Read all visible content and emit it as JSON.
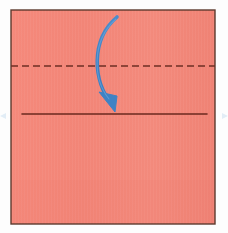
{
  "diagram": {
    "title": "Origami fold step",
    "type": "origami-instruction",
    "caption": "",
    "canvas": {
      "width": 228,
      "height": 233
    },
    "background_color": "#fdfdfd"
  },
  "paper": {
    "name": "square-sheet",
    "shape": "square",
    "fill_color": "#f4897b",
    "fill_color_shade": "#ef7e70",
    "border_color": "#5c3a2e",
    "border_width": 1.4,
    "x": 11,
    "y": 10,
    "width": 204,
    "height": 214
  },
  "fold_line": {
    "name": "valley-fold-line",
    "style": "dashed",
    "meaning": "fold line",
    "color": "#6e2f24",
    "stroke_width": 1.6,
    "dash_pattern": "7 4",
    "x1": 11,
    "y1": 66,
    "x2": 215,
    "y2": 66
  },
  "crease_line": {
    "name": "existing-crease-line",
    "style": "solid",
    "meaning": "existing crease / reference edge",
    "color": "#6b2a1f",
    "stroke_width": 1.6,
    "x1": 22,
    "y1": 114,
    "x2": 207,
    "y2": 114
  },
  "arrow": {
    "name": "fold-direction-arrow",
    "color": "#3f82c4",
    "highlight_color": "#68a6dd",
    "stroke_width": 3.6,
    "direction": "downward",
    "meaning": "fold top edge down to the crease",
    "start": {
      "x": 117,
      "y": 17
    },
    "control_1": {
      "x": 90,
      "y": 40
    },
    "control_2": {
      "x": 93,
      "y": 82
    },
    "end": {
      "x": 112,
      "y": 104
    },
    "head": {
      "tip": {
        "x": 115,
        "y": 112
      },
      "left": {
        "x": 99,
        "y": 92
      },
      "right": {
        "x": 117,
        "y": 96
      }
    }
  },
  "labels": {
    "step_number": "",
    "note": ""
  }
}
